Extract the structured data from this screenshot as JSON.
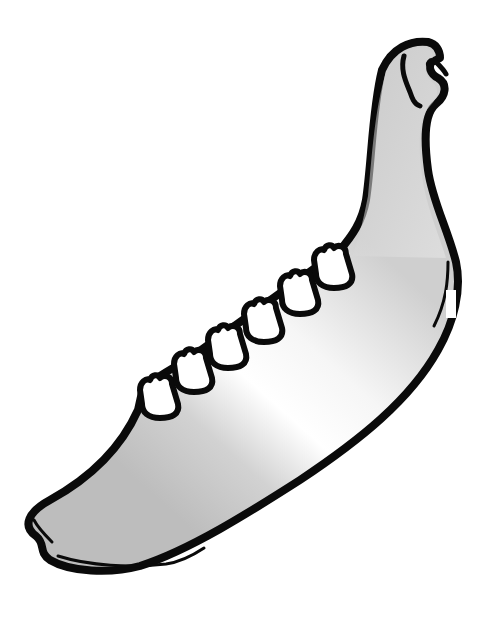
{
  "image": {
    "subject": "mandible",
    "description": "Line illustration of a lower jaw bone (mandible) with six visible teeth along the alveolar ridge",
    "tooth_count": 6,
    "colors": {
      "background": "#ffffff",
      "outline": "#0a0a0a",
      "bone_light": "#ffffff",
      "bone_shade": "#c8c8c8",
      "tooth_fill": "#ffffff"
    }
  }
}
